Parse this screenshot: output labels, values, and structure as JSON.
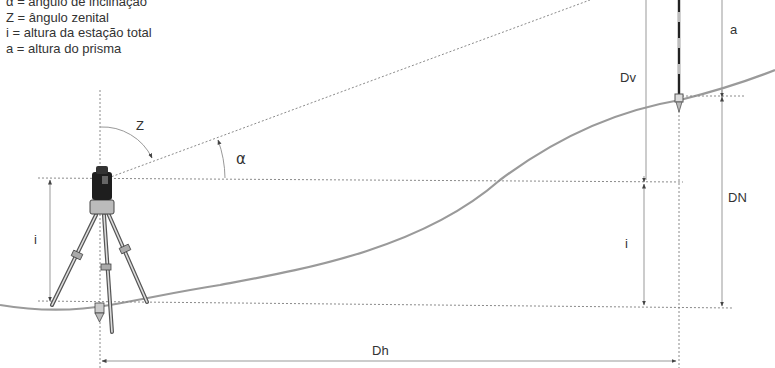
{
  "legend": {
    "items": [
      "α = ângulo de inclinação",
      "Z = ângulo zenital",
      "i = altura da estação total",
      "a = altura do prisma"
    ]
  },
  "labels": {
    "zenith_angle": "Z",
    "inclination_angle": "α",
    "instrument_height_left": "i",
    "instrument_height_right": "i",
    "vertical_distance": "Dv",
    "prism_height": "a",
    "level_difference": "DN",
    "horizontal_distance": "Dh"
  },
  "colors": {
    "line": "#999999",
    "terrain": "#9a9a9a",
    "text": "#333333",
    "instrument": "#222222"
  }
}
